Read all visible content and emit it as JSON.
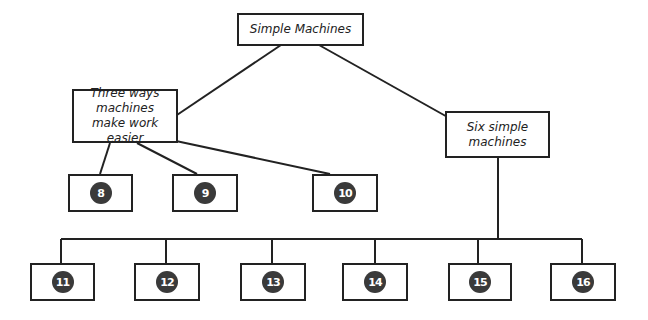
{
  "diagram": {
    "root": {
      "label": "Simple Machines"
    },
    "left_branch": {
      "label": "Three ways machines make work easier",
      "children": [
        "8",
        "9",
        "10"
      ]
    },
    "right_branch": {
      "label": "Six simple machines",
      "children": [
        "11",
        "12",
        "13",
        "14",
        "15",
        "16"
      ]
    },
    "colors": {
      "line": "#222222",
      "badge": "#3a3a3a",
      "badge_text": "#ffffff"
    }
  }
}
